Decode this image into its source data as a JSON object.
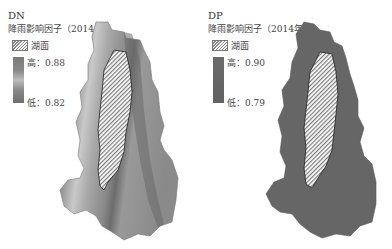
{
  "panels": [
    {
      "code": "DN",
      "subtitle": "降雨影响因子（2014年）",
      "lake_label": "湖面",
      "ramp_high": "高：0.88",
      "ramp_low": "低：0.82",
      "fill_style": "gradient"
    },
    {
      "code": "DP",
      "subtitle": "降雨影响因子（2014年）",
      "lake_label": "湖面",
      "ramp_high": "高：0.90",
      "ramp_low": "低：0.79",
      "fill_style": "uniform"
    }
  ],
  "colors": {
    "dn_light_band": "#c8c8c8",
    "dn_dark": "#6e6e6e",
    "dp_fill": "#666666",
    "lake_hatch_fg": "#888888",
    "lake_hatch_bg": "#ffffff"
  }
}
